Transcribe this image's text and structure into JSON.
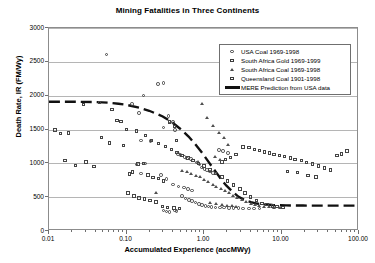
{
  "chart_data": {
    "type": "scatter",
    "title": "Mining Fatalities in Three Continents",
    "xlabel": "Accumulated Experience (accMWy)",
    "ylabel": "Death Rate, IR (FM/Wy)",
    "xscale": "log",
    "yscale": "linear",
    "xlim": [
      0.01,
      100
    ],
    "ylim": [
      0,
      3000
    ],
    "grid": "horizontal",
    "legend_position": "top-right-inside",
    "xticks": [
      "0.01",
      "0.10",
      "1.00",
      "10.00",
      "100.00"
    ],
    "xtick_values": [
      0.01,
      0.1,
      1,
      10,
      100
    ],
    "yticks": [
      "0",
      "500",
      "1000",
      "1500",
      "2000",
      "2500",
      "3000"
    ],
    "ytick_values": [
      0,
      500,
      1000,
      1500,
      2000,
      2500,
      3000
    ],
    "series": [
      {
        "name": "USA Coal 1969-1998",
        "marker": "circle",
        "points": [
          [
            0.055,
            2610
          ],
          [
            0.165,
            2000
          ],
          [
            0.3,
            2190
          ],
          [
            0.255,
            2170
          ],
          [
            0.118,
            1880
          ],
          [
            0.145,
            1740
          ],
          [
            0.35,
            1700
          ],
          [
            0.36,
            1620
          ],
          [
            0.4,
            1610
          ],
          [
            0.3,
            1530
          ],
          [
            0.42,
            1490
          ],
          [
            0.155,
            1340
          ],
          [
            0.205,
            1330
          ],
          [
            0.175,
            1000
          ],
          [
            0.135,
            980
          ],
          [
            0.46,
            1140
          ],
          [
            0.5,
            1120
          ],
          [
            0.56,
            1090
          ],
          [
            0.6,
            1070
          ],
          [
            0.68,
            1060
          ],
          [
            0.72,
            1040
          ],
          [
            0.8,
            1010
          ],
          [
            0.88,
            980
          ],
          [
            0.95,
            940
          ],
          [
            1.02,
            920
          ],
          [
            1.1,
            900
          ],
          [
            1.2,
            880
          ],
          [
            1.3,
            860
          ],
          [
            0.155,
            850
          ],
          [
            0.28,
            830
          ],
          [
            0.33,
            770
          ],
          [
            0.4,
            690
          ],
          [
            0.47,
            660
          ],
          [
            0.55,
            640
          ],
          [
            0.62,
            620
          ],
          [
            0.7,
            600
          ],
          [
            0.52,
            520
          ],
          [
            0.58,
            480
          ],
          [
            0.64,
            460
          ],
          [
            0.7,
            440
          ],
          [
            0.78,
            420
          ],
          [
            0.86,
            400
          ],
          [
            0.95,
            385
          ],
          [
            1.05,
            370
          ],
          [
            1.15,
            360
          ],
          [
            1.25,
            355
          ],
          [
            1.4,
            350
          ],
          [
            1.6,
            345
          ],
          [
            1.8,
            345
          ],
          [
            2.1,
            340
          ],
          [
            2.4,
            340
          ],
          [
            2.8,
            340
          ],
          [
            3.2,
            335
          ],
          [
            3.8,
            335
          ],
          [
            4.4,
            330
          ],
          [
            5.2,
            330
          ],
          [
            0.3,
            300
          ],
          [
            0.33,
            290
          ],
          [
            0.36,
            285
          ],
          [
            0.42,
            300
          ],
          [
            0.44,
            295
          ],
          [
            1.55,
            1200
          ],
          [
            1.75,
            1180
          ],
          [
            2.05,
            1150
          ]
        ]
      },
      {
        "name": "South Africa Gold 1969-1999",
        "marker": "square",
        "points": [
          [
            0.012,
            1490
          ],
          [
            0.014,
            1440
          ],
          [
            0.016,
            1040
          ],
          [
            0.022,
            970
          ],
          [
            0.03,
            1020
          ],
          [
            0.038,
            950
          ],
          [
            0.048,
            1380
          ],
          [
            0.06,
            1300
          ],
          [
            0.075,
            1630
          ],
          [
            0.092,
            1260
          ],
          [
            0.11,
            840
          ],
          [
            0.12,
            870
          ],
          [
            0.14,
            990
          ],
          [
            0.165,
            1000
          ],
          [
            0.19,
            830
          ],
          [
            0.22,
            790
          ],
          [
            0.26,
            780
          ],
          [
            0.3,
            740
          ],
          [
            0.105,
            560
          ],
          [
            0.125,
            520
          ],
          [
            0.145,
            490
          ],
          [
            0.17,
            470
          ],
          [
            0.2,
            450
          ],
          [
            0.24,
            430
          ],
          [
            0.29,
            360
          ],
          [
            0.34,
            345
          ],
          [
            0.41,
            340
          ],
          [
            0.48,
            335
          ],
          [
            4.5,
            1200
          ],
          [
            5.2,
            1190
          ],
          [
            6.0,
            1170
          ],
          [
            7.0,
            1150
          ],
          [
            8.0,
            1130
          ],
          [
            9.5,
            1120
          ],
          [
            11.0,
            1100
          ],
          [
            13.0,
            1080
          ],
          [
            15.0,
            1060
          ],
          [
            18.0,
            1040
          ],
          [
            21.0,
            1010
          ],
          [
            25.0,
            990
          ],
          [
            30.0,
            960
          ],
          [
            36.0,
            930
          ],
          [
            43.0,
            900
          ],
          [
            52.0,
            1120
          ],
          [
            60.0,
            1140
          ],
          [
            70.0,
            1180
          ],
          [
            3.2,
            1240
          ],
          [
            3.8,
            1230
          ],
          [
            2.6,
            1130
          ],
          [
            2.2,
            1090
          ],
          [
            1.9,
            1060
          ],
          [
            1.7,
            1020
          ],
          [
            12.0,
            880
          ],
          [
            16.0,
            860
          ],
          [
            22.0,
            820
          ],
          [
            28.0,
            800
          ]
        ]
      },
      {
        "name": "South Africa Coal 1969-1998",
        "marker": "triangle",
        "points": [
          [
            0.24,
            560
          ],
          [
            0.52,
            890
          ],
          [
            0.6,
            870
          ],
          [
            0.68,
            840
          ],
          [
            0.78,
            820
          ],
          [
            0.88,
            800
          ],
          [
            1.0,
            760
          ],
          [
            1.12,
            730
          ],
          [
            1.3,
            690
          ],
          [
            1.45,
            660
          ],
          [
            1.65,
            630
          ],
          [
            1.85,
            600
          ],
          [
            2.1,
            560
          ],
          [
            2.4,
            520
          ],
          [
            2.7,
            490
          ],
          [
            3.1,
            460
          ],
          [
            3.5,
            430
          ],
          [
            4.0,
            410
          ],
          [
            4.6,
            390
          ],
          [
            5.2,
            375
          ],
          [
            6.0,
            365
          ],
          [
            7.0,
            355
          ],
          [
            8.0,
            350
          ],
          [
            9.5,
            345
          ],
          [
            0.95,
            1880
          ],
          [
            1.3,
            1560
          ],
          [
            1.55,
            1450
          ],
          [
            1.8,
            1380
          ],
          [
            2.05,
            1280
          ],
          [
            1.1,
            1680
          ],
          [
            1.4,
            1100
          ],
          [
            1.6,
            1060
          ],
          [
            1.2,
            420
          ],
          [
            1.45,
            405
          ],
          [
            1.7,
            390
          ],
          [
            2.0,
            380
          ],
          [
            2.3,
            370
          ],
          [
            2.6,
            360
          ],
          [
            0.85,
            1020
          ]
        ]
      },
      {
        "name": "Queensland Coal 1901-1998",
        "marker": "square",
        "points": [
          [
            0.018,
            1450
          ],
          [
            0.028,
            1870
          ],
          [
            0.045,
            1900
          ],
          [
            0.065,
            1800
          ],
          [
            0.085,
            1620
          ],
          [
            0.1,
            1500
          ],
          [
            0.135,
            1480
          ],
          [
            0.175,
            1410
          ],
          [
            0.21,
            1340
          ],
          [
            0.26,
            1290
          ],
          [
            0.32,
            1250
          ],
          [
            0.38,
            1200
          ],
          [
            0.45,
            1160
          ],
          [
            0.52,
            1120
          ],
          [
            0.62,
            1080
          ],
          [
            0.72,
            1040
          ],
          [
            0.85,
            1000
          ],
          [
            1.0,
            960
          ],
          [
            1.2,
            900
          ],
          [
            1.4,
            850
          ],
          [
            1.7,
            800
          ],
          [
            2.0,
            740
          ],
          [
            2.4,
            680
          ],
          [
            2.9,
            620
          ],
          [
            3.4,
            560
          ],
          [
            4.0,
            500
          ],
          [
            4.8,
            450
          ],
          [
            5.6,
            410
          ],
          [
            6.5,
            390
          ],
          [
            7.6,
            370
          ],
          [
            8.8,
            360
          ],
          [
            10.5,
            350
          ],
          [
            0.42,
            1540
          ],
          [
            0.36,
            1610
          ],
          [
            0.44,
            1340
          ]
        ]
      }
    ],
    "prediction_line": {
      "name": "MERE Prediction from USA data",
      "style": "thick-dashed",
      "points": [
        [
          0.01,
          1900
        ],
        [
          0.02,
          1900
        ],
        [
          0.04,
          1895
        ],
        [
          0.06,
          1885
        ],
        [
          0.08,
          1870
        ],
        [
          0.1,
          1855
        ],
        [
          0.15,
          1810
        ],
        [
          0.2,
          1765
        ],
        [
          0.3,
          1680
        ],
        [
          0.4,
          1590
        ],
        [
          0.5,
          1500
        ],
        [
          0.65,
          1380
        ],
        [
          0.8,
          1260
        ],
        [
          1.0,
          1120
        ],
        [
          1.2,
          990
        ],
        [
          1.45,
          860
        ],
        [
          1.7,
          750
        ],
        [
          2.0,
          650
        ],
        [
          2.4,
          560
        ],
        [
          2.9,
          480
        ],
        [
          3.5,
          430
        ],
        [
          4.2,
          400
        ],
        [
          5.0,
          380
        ],
        [
          6.5,
          365
        ],
        [
          8.0,
          358
        ],
        [
          12.0,
          352
        ],
        [
          20.0,
          350
        ],
        [
          40.0,
          348
        ],
        [
          70.0,
          348
        ],
        [
          100.0,
          348
        ]
      ]
    }
  },
  "legend": {
    "items": [
      {
        "label": "USA Coal 1969-1998",
        "marker": "circle"
      },
      {
        "label": "South Africa Gold 1969-1999",
        "marker": "square"
      },
      {
        "label": "South Africa Coal 1969-1998",
        "marker": "triangle"
      },
      {
        "label": "Queensland Coal 1901-1998",
        "marker": "square"
      },
      {
        "label": "MERE Prediction from USA data",
        "marker": "line"
      }
    ]
  },
  "colors": {
    "background": "#ffffff",
    "frame": "#8c8c8c",
    "gridline": "#b5b5b5",
    "marker_stroke": "#444444",
    "prediction_line": "#111111",
    "text": "#000000"
  }
}
